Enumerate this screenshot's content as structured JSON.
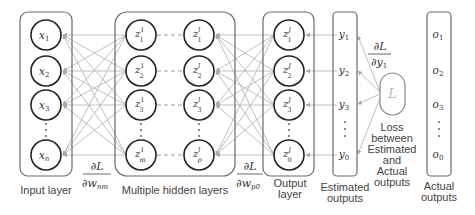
{
  "diagram": {
    "colors": {
      "box_stroke": "#666666",
      "node_stroke": "#222222",
      "edge": "#b3b3b3",
      "dashed": "#999999",
      "loss_stroke": "#888888",
      "text": "#444444"
    },
    "input_layer": {
      "label": "Input layer",
      "nodes": [
        {
          "base": "x",
          "sub": "1"
        },
        {
          "base": "x",
          "sub": "2"
        },
        {
          "base": "x",
          "sub": "3"
        },
        {
          "base": "x",
          "sub": "n"
        }
      ]
    },
    "hidden_layers": {
      "label": "Multiple hidden layers",
      "first": [
        {
          "base": "z",
          "sup": "1",
          "sub": "1"
        },
        {
          "base": "z",
          "sup": "1",
          "sub": "2"
        },
        {
          "base": "z",
          "sup": "1",
          "sub": "3"
        },
        {
          "base": "z",
          "sup": "1",
          "sub": "m"
        }
      ],
      "last": [
        {
          "base": "z",
          "sup": "l",
          "sub": "1"
        },
        {
          "base": "z",
          "sup": "l",
          "sub": "2"
        },
        {
          "base": "z",
          "sup": "l",
          "sub": "3"
        },
        {
          "base": "z",
          "sup": "l",
          "sub": "p"
        }
      ]
    },
    "output_layer": {
      "label_line1": "Output",
      "label_line2": "layer",
      "nodes": [
        {
          "base": "z",
          "sup": "J",
          "sub": "1"
        },
        {
          "base": "z",
          "sup": "J",
          "sub": "2"
        },
        {
          "base": "z",
          "sup": "J",
          "sub": "3"
        },
        {
          "base": "z",
          "sup": "J",
          "sub": "0"
        }
      ]
    },
    "estimated_outputs": {
      "label_line1": "Estimated",
      "label_line2": "outputs",
      "values": [
        {
          "base": "y",
          "sub": "1"
        },
        {
          "base": "y",
          "sub": "2"
        },
        {
          "base": "y",
          "sub": "3"
        },
        {
          "base": "y",
          "sub": "0"
        }
      ]
    },
    "loss": {
      "symbol": "L",
      "caption": [
        "Loss",
        "between",
        "Estimated",
        "and",
        "Actual",
        "outputs"
      ]
    },
    "actual_outputs": {
      "label_line1": "Actual",
      "label_line2": "outputs",
      "values": [
        {
          "base": "o",
          "sub": "1"
        },
        {
          "base": "o",
          "sub": "2"
        },
        {
          "base": "o",
          "sub": "3"
        },
        {
          "base": "o",
          "sub": "0"
        }
      ]
    },
    "gradients": {
      "input_hidden": {
        "num": "∂L",
        "den": "∂w",
        "den_sub": "nm"
      },
      "hidden_output": {
        "num": "∂L",
        "den": "∂w",
        "den_sub": "p0"
      },
      "loss_estimate": {
        "num": "∂L",
        "den": "∂y",
        "den_sub": "1"
      }
    },
    "ellipsis": "·"
  }
}
